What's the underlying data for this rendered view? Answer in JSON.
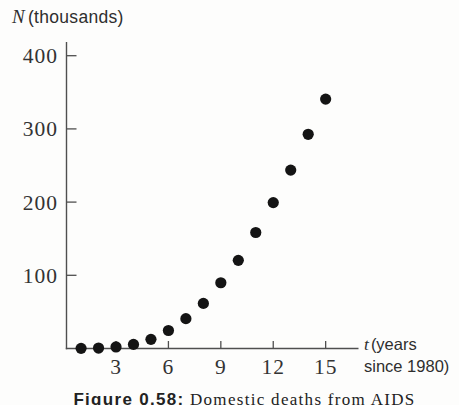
{
  "figure": {
    "y_axis_title": {
      "symbol": "N",
      "unit": "(thousands)"
    },
    "x_axis_title": {
      "symbol": "t",
      "unit_line1": "(years",
      "unit_line2": "since 1980)"
    },
    "caption": {
      "label": "Figure 0.58:",
      "text": "Domestic deaths from AIDS"
    }
  },
  "chart_data": {
    "type": "scatter",
    "title": "Figure 0.58: Domestic deaths from AIDS",
    "xlabel": "t (years since 1980)",
    "ylabel": "N (thousands)",
    "x": [
      1,
      2,
      3,
      4,
      5,
      6,
      7,
      8,
      9,
      10,
      11,
      12,
      13,
      14,
      15
    ],
    "values": [
      0.2,
      0.6,
      2.1,
      5.6,
      12.5,
      24.6,
      40.8,
      61.6,
      89.8,
      120.4,
      158.5,
      199.3,
      243.7,
      292.6,
      340.7
    ],
    "x_ticks": [
      3,
      6,
      9,
      12,
      15
    ],
    "y_ticks": [
      100,
      200,
      300,
      400
    ],
    "xlim": [
      0.15,
      16.9
    ],
    "ylim": [
      0,
      420
    ],
    "grid": false,
    "legend": null,
    "marker": {
      "shape": "circle",
      "color": "#141414",
      "radius_px": 5.6
    },
    "colors": {
      "axis": "#4f4f4f",
      "tick_text": "#333333",
      "background": "#fdfdfc"
    }
  }
}
